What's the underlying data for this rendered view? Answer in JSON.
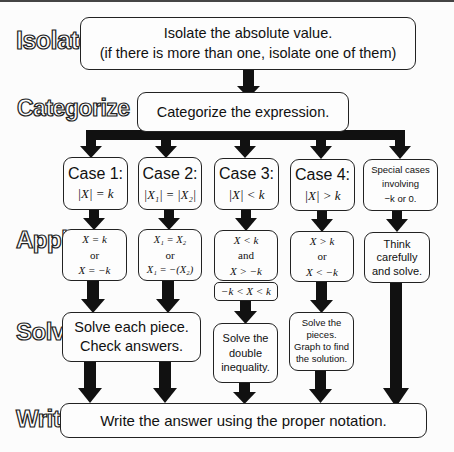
{
  "stages": {
    "isolate": "Isolate",
    "categorize": "Categorize",
    "apply": "Apply",
    "solve": "Solve",
    "write": "Write"
  },
  "isolate_box": {
    "line1": "Isolate the absolute value.",
    "line2": "(if there is more than one, isolate one of them)"
  },
  "categorize_box": {
    "text": "Categorize the expression."
  },
  "cases": [
    {
      "title": "Case 1:",
      "condition": "|X| = k",
      "apply": [
        "X = k",
        "or",
        "X = −k"
      ]
    },
    {
      "title": "Case 2:",
      "condition": "|X₁| = |X₂|",
      "apply": [
        "X₁ = X₂",
        "or",
        "X₁ = −(X₂)"
      ]
    },
    {
      "title": "Case 3:",
      "condition": "|X| < k",
      "apply": [
        "X < k",
        "and",
        "X > −k"
      ],
      "combined": "−k < X < k",
      "solve": [
        "Solve the",
        "double",
        "inequality."
      ]
    },
    {
      "title": "Case 4:",
      "condition": "|X| > k",
      "apply": [
        "X > k",
        "or",
        "X < −k"
      ],
      "solve": [
        "Solve the",
        "pieces.",
        "Graph to find",
        "the solution."
      ]
    },
    {
      "title_lines": [
        "Special cases",
        "involving",
        "−k or 0."
      ],
      "apply": [
        "Think",
        "carefully",
        "and solve."
      ]
    }
  ],
  "solve_shared": {
    "line1": "Solve each piece.",
    "line2": "Check answers."
  },
  "write_box": {
    "text": "Write the answer using the proper notation."
  },
  "colors": {
    "arrow": "#111111",
    "border": "#222222",
    "background": "#fcfcfc"
  }
}
